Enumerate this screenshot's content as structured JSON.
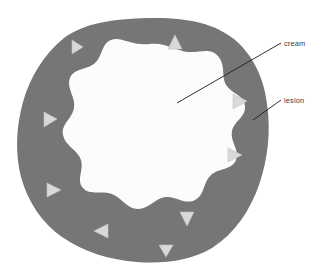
{
  "figure": {
    "background_color": "#ffffff"
  },
  "regions": {
    "lesion": {
      "name": "lesion",
      "label": "lesion",
      "fill_color": "#767676",
      "description": "outer irregular grey rim representing the lesion tissue"
    },
    "cream": {
      "name": "cream",
      "label": "cream",
      "fill_color": "#fcfcfa",
      "description": "inner irregular near-white region representing the applied cream"
    }
  },
  "markers": {
    "name": "penetration-arrows",
    "fill_color": "#d9d9d9",
    "stroke_color": "#c2c2c2",
    "count": 9,
    "items": [
      {
        "id": "marker-top-left",
        "direction": "right",
        "x": 77,
        "y": 47
      },
      {
        "id": "marker-top",
        "direction": "up",
        "x": 175,
        "y": 42
      },
      {
        "id": "marker-upper-left",
        "direction": "right",
        "x": 60,
        "y": 118
      },
      {
        "id": "marker-left",
        "direction": "right",
        "x": 48,
        "y": 125
      },
      {
        "id": "marker-lower-left",
        "direction": "right",
        "x": 54,
        "y": 190
      },
      {
        "id": "marker-bottom-left",
        "direction": "left",
        "x": 100,
        "y": 231
      },
      {
        "id": "marker-bottom",
        "direction": "down",
        "x": 188,
        "y": 219
      },
      {
        "id": "marker-right",
        "direction": "right",
        "x": 240,
        "y": 101
      },
      {
        "id": "marker-lower-right",
        "direction": "right",
        "x": 235,
        "y": 155
      }
    ]
  },
  "callouts": {
    "stroke_color": "#1a1a1a",
    "items": [
      {
        "id": "callout-cream",
        "label": "cream",
        "target_region": "cream",
        "text_x": 284,
        "text_y": 46,
        "line_from_x": 281,
        "line_from_y": 43,
        "line_to_x": 177,
        "line_to_y": 103
      },
      {
        "id": "callout-lesion",
        "label": "lesion",
        "target_region": "lesion",
        "text_x": 284,
        "text_y": 103,
        "line_from_x": 281,
        "line_from_y": 100,
        "line_to_x": 253,
        "line_to_y": 120
      }
    ]
  }
}
